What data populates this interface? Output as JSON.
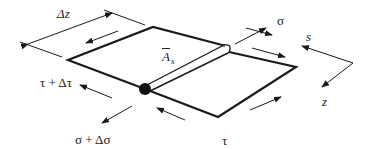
{
  "diagram": {
    "labels": {
      "delta_z": "Δz",
      "sigma": "σ",
      "s_axis": "s",
      "z_axis": "z",
      "area_main": "A",
      "area_sub": "s",
      "tau_plus": "τ + Δτ",
      "sigma_plus": "σ + Δσ",
      "tau": "τ"
    },
    "colors": {
      "stroke": "#1a1a1a",
      "background": "#ffffff",
      "text": "#222222"
    }
  }
}
